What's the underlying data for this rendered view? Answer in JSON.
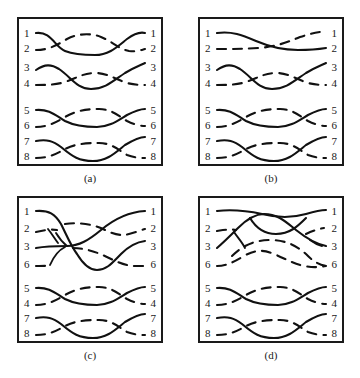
{
  "figure": {
    "title": "",
    "panel_count": 4,
    "strand_count_per_panel": 8
  },
  "panels": [
    {
      "id": "a",
      "caption": "(a)",
      "left_labels": [
        "1",
        "2",
        "3",
        "4",
        "5",
        "6",
        "7",
        "8"
      ],
      "right_labels": [
        "1",
        "2",
        "3",
        "4",
        "5",
        "6",
        "7",
        "8"
      ],
      "groups": [
        {
          "rows": [
            "1",
            "2"
          ],
          "pattern": "cross-weave",
          "crossings": 2
        },
        {
          "rows": [
            "3",
            "4"
          ],
          "pattern": "cross-weave",
          "crossings": 2
        },
        {
          "rows": [
            "5",
            "6"
          ],
          "pattern": "cross-weave",
          "crossings": 2
        },
        {
          "rows": [
            "7",
            "8"
          ],
          "pattern": "cross-weave",
          "crossings": 2
        }
      ]
    },
    {
      "id": "b",
      "caption": "(b)",
      "left_labels": [
        "1",
        "2",
        "3",
        "4",
        "5",
        "6",
        "7",
        "8"
      ],
      "right_labels": [
        "1",
        "2",
        "3",
        "4",
        "5",
        "6",
        "7",
        "8"
      ],
      "groups": [
        {
          "rows": [
            "1",
            "2"
          ],
          "pattern": "single-cross",
          "crossings": 1
        },
        {
          "rows": [
            "3",
            "4"
          ],
          "pattern": "cross-weave",
          "crossings": 2
        },
        {
          "rows": [
            "5",
            "6"
          ],
          "pattern": "cross-weave",
          "crossings": 2
        },
        {
          "rows": [
            "7",
            "8"
          ],
          "pattern": "cross-weave",
          "crossings": 2
        }
      ]
    },
    {
      "id": "c",
      "caption": "(c)",
      "left_labels": [
        "1",
        "2",
        "3",
        "6",
        "5",
        "4",
        "7",
        "8"
      ],
      "right_labels": [
        "1",
        "2",
        "3",
        "6",
        "5",
        "4",
        "7",
        "8"
      ],
      "groups": [
        {
          "rows": [
            "1",
            "2",
            "3",
            "6"
          ],
          "pattern": "four-strand-tangle",
          "crossings": 5
        },
        {
          "rows": [
            "5",
            "4"
          ],
          "pattern": "cross-weave",
          "crossings": 2
        },
        {
          "rows": [
            "7",
            "8"
          ],
          "pattern": "cross-weave",
          "crossings": 2
        }
      ]
    },
    {
      "id": "d",
      "caption": "(d)",
      "left_labels": [
        "1",
        "2",
        "3",
        "6",
        "5",
        "4",
        "7",
        "8"
      ],
      "right_labels": [
        "1",
        "2",
        "3",
        "6",
        "5",
        "4",
        "7",
        "8"
      ],
      "groups": [
        {
          "rows": [
            "1",
            "2",
            "3",
            "6"
          ],
          "pattern": "four-strand-braid",
          "crossings": 4
        },
        {
          "rows": [
            "5",
            "4"
          ],
          "pattern": "cross-weave",
          "crossings": 2
        },
        {
          "rows": [
            "7",
            "8"
          ],
          "pattern": "cross-weave",
          "crossings": 2
        }
      ]
    }
  ],
  "colors": {
    "stroke": "#111111",
    "frame": "#1a1a1a",
    "background": "#ffffff"
  }
}
